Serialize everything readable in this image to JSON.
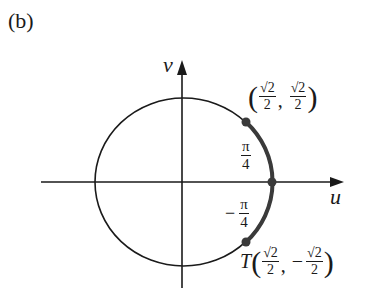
{
  "panel_label": "(b)",
  "axes": {
    "horizontal_label": "u",
    "vertical_label": "v"
  },
  "points": {
    "upper": {
      "open": "(",
      "x_num": "√2",
      "x_den": "2",
      "sep": ",",
      "y_sign": "",
      "y_num": "√2",
      "y_den": "2",
      "close": ")"
    },
    "lower": {
      "name": "T",
      "open": "(",
      "x_num": "√2",
      "x_den": "2",
      "sep": ",",
      "y_sign": "−",
      "y_num": "√2",
      "y_den": "2",
      "close": ")"
    }
  },
  "angles": {
    "upper": {
      "sign": "",
      "num": "π",
      "den": "4"
    },
    "lower": {
      "sign": "−",
      "num": "π",
      "den": "4"
    }
  },
  "colors": {
    "stroke": "#1a1a1a",
    "highlight_arc": "#3a3a3a"
  }
}
